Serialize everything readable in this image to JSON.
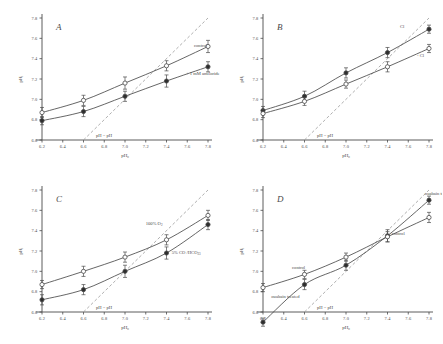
{
  "figure": {
    "panels": [
      "A",
      "B",
      "C",
      "D"
    ],
    "axis": {
      "xlabel": "pH",
      "xlabel_sub": "o",
      "ylabel": "pH",
      "ylabel_sub": "i",
      "xticks": [
        "6.2",
        "6.4",
        "6.6",
        "6.8",
        "7.0",
        "7.2",
        "7.4",
        "7.6",
        "7.8"
      ],
      "yticks": [
        "6.6",
        "6.8",
        "7.0",
        "7.2",
        "7.4",
        "7.6",
        "7.8"
      ],
      "xlim": [
        6.2,
        7.8
      ],
      "ylim": [
        6.6,
        7.8
      ]
    },
    "identity_line_label": "pH  = pH",
    "identity_label_sub_left": "i",
    "identity_label_sub_right": "o"
  },
  "chart_data": [
    {
      "type": "scatter",
      "panel": "A",
      "title": "A",
      "xlabel": "pHo",
      "ylabel": "pHi",
      "xlim": [
        6.2,
        7.8
      ],
      "ylim": [
        6.6,
        7.8
      ],
      "grid": false,
      "identity_line": true,
      "identity_annotation": "pHi = pHo",
      "series": [
        {
          "name": "control",
          "marker": "open-circle",
          "label": "control",
          "x": [
            6.2,
            6.6,
            7.0,
            7.4,
            7.8
          ],
          "y": [
            6.87,
            6.99,
            7.16,
            7.33,
            7.52
          ],
          "yerr": [
            0.05,
            0.05,
            0.06,
            0.05,
            0.06
          ]
        },
        {
          "name": "+ 1 mM amiloride",
          "marker": "filled-circle",
          "label": "+ 1 mM amiloride",
          "x": [
            6.2,
            6.6,
            7.0,
            7.4,
            7.8
          ],
          "y": [
            6.79,
            6.88,
            7.03,
            7.18,
            7.32
          ],
          "yerr": [
            0.04,
            0.05,
            0.05,
            0.06,
            0.05
          ]
        }
      ]
    },
    {
      "type": "scatter",
      "panel": "B",
      "title": "B",
      "xlabel": "pHo",
      "ylabel": "pHi",
      "xlim": [
        6.2,
        7.8
      ],
      "ylim": [
        6.6,
        7.8
      ],
      "grid": false,
      "identity_line": true,
      "identity_annotation": "pHi = pHo",
      "series": [
        {
          "name": "Cl",
          "marker": "filled-circle",
          "label": "Cl",
          "x": [
            6.2,
            6.6,
            7.0,
            7.4,
            7.8
          ],
          "y": [
            6.89,
            7.03,
            7.26,
            7.46,
            7.69
          ],
          "yerr": [
            0.04,
            0.05,
            0.05,
            0.05,
            0.04
          ]
        },
        {
          "name": "- Cl",
          "marker": "open-circle",
          "label": "- Cl",
          "x": [
            6.2,
            6.6,
            7.0,
            7.4,
            7.8
          ],
          "y": [
            6.86,
            6.98,
            7.15,
            7.32,
            7.5
          ],
          "yerr": [
            0.04,
            0.04,
            0.04,
            0.05,
            0.04
          ]
        }
      ]
    },
    {
      "type": "scatter",
      "panel": "C",
      "title": "C",
      "xlabel": "pHo",
      "ylabel": "pHi",
      "xlim": [
        6.2,
        7.8
      ],
      "ylim": [
        6.6,
        7.8
      ],
      "grid": false,
      "identity_line": true,
      "identity_annotation": "pHi = pHo",
      "series": [
        {
          "name": "100% O2",
          "marker": "open-circle",
          "label": "100% O",
          "label_sub": "2",
          "x": [
            6.2,
            6.6,
            7.0,
            7.4,
            7.8
          ],
          "y": [
            6.87,
            7.0,
            7.14,
            7.31,
            7.55
          ],
          "yerr": [
            0.04,
            0.05,
            0.05,
            0.05,
            0.05
          ]
        },
        {
          "name": "5% CO2/HCO3",
          "marker": "filled-circle",
          "label": "5% CO  /HCO",
          "label_sub": "2",
          "label_sub2": "3",
          "x": [
            6.2,
            6.6,
            7.0,
            7.4,
            7.8
          ],
          "y": [
            6.72,
            6.82,
            7.0,
            7.18,
            7.46
          ],
          "yerr": [
            0.05,
            0.05,
            0.06,
            0.06,
            0.05
          ]
        }
      ]
    },
    {
      "type": "scatter",
      "panel": "D",
      "title": "D",
      "xlabel": "pHo",
      "ylabel": "pHi",
      "xlim": [
        6.2,
        7.8
      ],
      "ylim": [
        6.6,
        7.8
      ],
      "grid": false,
      "identity_line": true,
      "identity_annotation": "pHi = pHo",
      "series": [
        {
          "name": "ouabain treated",
          "marker": "filled-circle",
          "label": "ouabain treated",
          "label_right": "ouabain treated",
          "x": [
            6.2,
            6.6,
            7.0,
            7.4,
            7.8
          ],
          "y": [
            6.5,
            6.87,
            7.06,
            7.35,
            7.7
          ],
          "yerr": [
            0.04,
            0.05,
            0.05,
            0.06,
            0.04
          ]
        },
        {
          "name": "control",
          "marker": "open-circle",
          "label": "control",
          "label_right": "control",
          "x": [
            6.2,
            6.6,
            7.0,
            7.4,
            7.8
          ],
          "y": [
            6.84,
            6.97,
            7.14,
            7.34,
            7.53
          ],
          "yerr": [
            0.04,
            0.04,
            0.04,
            0.05,
            0.05
          ]
        }
      ]
    }
  ]
}
